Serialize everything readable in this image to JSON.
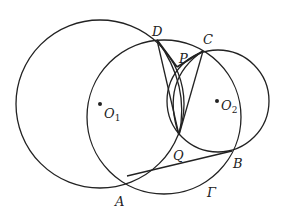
{
  "diagram": {
    "type": "geometry",
    "circles": [
      {
        "id": "O1",
        "center": [
          100,
          104
        ],
        "r": 84,
        "label": "O",
        "sub": "1"
      },
      {
        "id": "O2",
        "center": [
          218,
          101
        ],
        "r": 51,
        "label": "O",
        "sub": "2"
      },
      {
        "id": "Gamma",
        "center": [
          164,
          117
        ],
        "r": 77,
        "label": "Γ"
      }
    ],
    "points": {
      "A": {
        "label": "A",
        "pos": [
          127,
          176
        ]
      },
      "B": {
        "label": "B",
        "pos": [
          232,
          151
        ]
      },
      "C": {
        "label": "C",
        "pos": [
          203,
          51
        ]
      },
      "D": {
        "label": "D",
        "pos": [
          157,
          40
        ]
      },
      "P": {
        "label": "P",
        "pos": [
          177,
          67
        ]
      },
      "Q": {
        "label": "Q",
        "pos": [
          179,
          135
        ]
      }
    },
    "segments": [
      "DP",
      "PC",
      "DQ",
      "CQ",
      "QA",
      "AB",
      "PQ"
    ],
    "labels": {
      "A": "A",
      "B": "B",
      "C": "C",
      "D": "D",
      "P": "P",
      "Q": "Q",
      "O1": "O",
      "O1_sub": "1",
      "O2": "O",
      "O2_sub": "2",
      "Gamma": "Γ"
    },
    "stroke_color": "#222222"
  }
}
